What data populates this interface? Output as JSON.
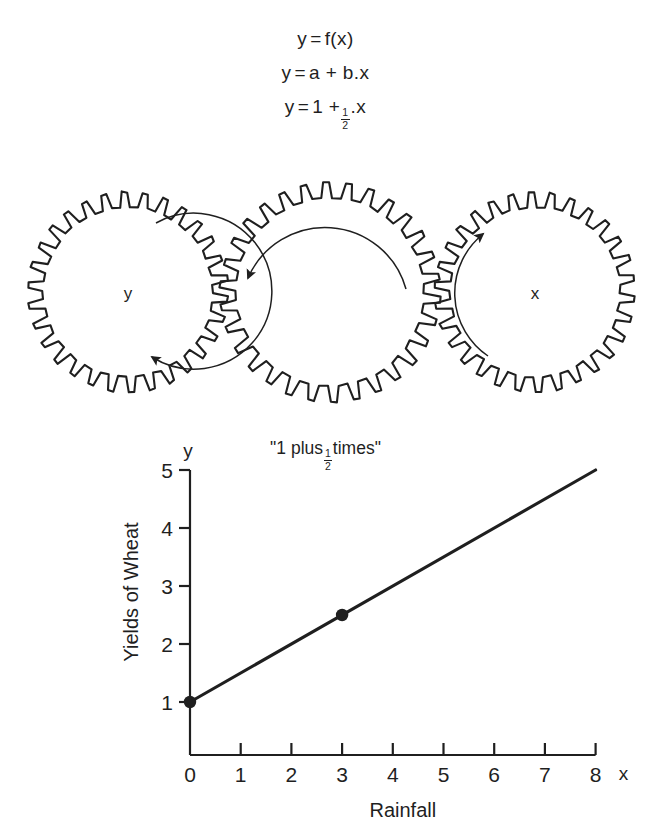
{
  "equations": [
    {
      "id": "general-function",
      "lhs": "y",
      "eq": "=",
      "rhs": "f(x)"
    },
    {
      "id": "linear-general",
      "lhs": "y",
      "eq": "=",
      "rhs": "a + b.x"
    },
    {
      "id": "linear-specific",
      "lhs": "y",
      "eq": "=",
      "pre": "1 +",
      "num": "1",
      "den": "2",
      "post": ".x"
    }
  ],
  "gears": {
    "left": {
      "label": "y",
      "rotation": "clockwise"
    },
    "middle": {
      "label": "\"1 plus ½ times\"",
      "label_pre": "\"1 plus",
      "label_num": "1",
      "label_den": "2",
      "label_post": "times\"",
      "rotation": "counter-clockwise"
    },
    "right": {
      "label": "x",
      "rotation": "counter-clockwise"
    },
    "teeth_count": 30
  },
  "chart_data": {
    "type": "line",
    "title": "",
    "xlabel": "Rainfall",
    "ylabel": "Yields of Wheat",
    "x_axis_symbol": "x",
    "y_axis_symbol": "y",
    "xlim": [
      0,
      8
    ],
    "ylim": [
      0,
      5
    ],
    "xticks": [
      "0",
      "1",
      "2",
      "3",
      "4",
      "5",
      "6",
      "7",
      "8"
    ],
    "yticks": [
      "1",
      "2",
      "3",
      "4",
      "5"
    ],
    "grid": false,
    "legend": "none",
    "series": [
      {
        "name": "y = 1 + 0.5x",
        "intercept": 1,
        "slope": 0.5,
        "x": [
          0,
          8
        ],
        "values": [
          1,
          5
        ]
      }
    ],
    "markers": [
      {
        "x": 0,
        "y": 1
      },
      {
        "x": 3,
        "y": 2.5
      }
    ]
  },
  "colors": {
    "ink": "#1f1f1f",
    "background": "#ffffff"
  }
}
